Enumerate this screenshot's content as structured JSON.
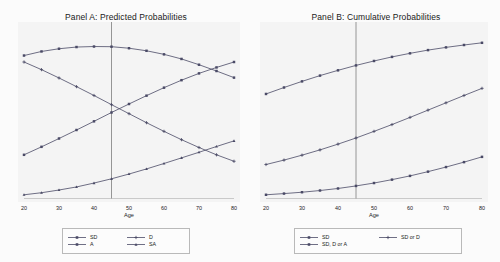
{
  "figure": {
    "background_color": "#fbfbfb",
    "panel_background_color": "#f4f4f4",
    "series_color": "#4a4a66",
    "reference_line_color": "#8a8a8a",
    "axis_color": "#c9c9c9"
  },
  "panels": {
    "a": {
      "title": "Panel A: Predicted Probabilities",
      "xlabel": "Age",
      "legend": [
        {
          "label": "SD",
          "marker": "square"
        },
        {
          "label": "D",
          "marker": "plus"
        },
        {
          "label": "A",
          "marker": "square"
        },
        {
          "label": "SA",
          "marker": "triangle"
        }
      ]
    },
    "b": {
      "title": "Panel B: Cumulative Probabilities",
      "xlabel": "Age",
      "legend": [
        {
          "label": "SD",
          "marker": "square"
        },
        {
          "label": "SD or D",
          "marker": "plus"
        },
        {
          "label": "SD, D or A",
          "marker": "square"
        }
      ]
    }
  },
  "chart_data": [
    {
      "type": "line",
      "panel": "A",
      "title": "Panel A: Predicted Probabilities",
      "xlabel": "Age",
      "ylabel": "",
      "xlim": [
        20,
        80
      ],
      "ylim": [
        0,
        1
      ],
      "xticks": [
        20,
        30,
        40,
        50,
        60,
        70,
        80
      ],
      "xtick_labels": [
        "20",
        "30",
        "40",
        "50",
        "60",
        "70",
        "80"
      ],
      "grid": false,
      "legend_position": "below",
      "annotations": [
        {
          "type": "vertical-reference-line",
          "x": 45
        }
      ],
      "x": [
        20,
        25,
        30,
        35,
        40,
        45,
        50,
        55,
        60,
        65,
        70,
        75,
        80
      ],
      "series": [
        {
          "name": "SD",
          "marker": "square",
          "values": [
            0.838,
            0.862,
            0.878,
            0.888,
            0.891,
            0.89,
            0.881,
            0.866,
            0.845,
            0.818,
            0.784,
            0.747,
            0.708
          ]
        },
        {
          "name": "D",
          "marker": "plus",
          "values": [
            0.8,
            0.755,
            0.706,
            0.655,
            0.603,
            0.549,
            0.496,
            0.443,
            0.392,
            0.343,
            0.297,
            0.254,
            0.216
          ]
        },
        {
          "name": "A",
          "marker": "square",
          "values": [
            0.254,
            0.301,
            0.35,
            0.4,
            0.451,
            0.503,
            0.553,
            0.602,
            0.649,
            0.693,
            0.733,
            0.768,
            0.8
          ]
        },
        {
          "name": "SA",
          "marker": "triangle",
          "values": [
            0.019,
            0.031,
            0.047,
            0.065,
            0.088,
            0.113,
            0.141,
            0.171,
            0.203,
            0.236,
            0.269,
            0.303,
            0.336
          ]
        }
      ]
    },
    {
      "type": "line",
      "panel": "B",
      "title": "Panel B: Cumulative Probabilities",
      "xlabel": "Age",
      "ylabel": "",
      "xlim": [
        20,
        80
      ],
      "ylim": [
        0,
        1
      ],
      "xticks": [
        20,
        30,
        40,
        50,
        60,
        70,
        80
      ],
      "xtick_labels": [
        "20",
        "30",
        "40",
        "50",
        "60",
        "70",
        "80"
      ],
      "grid": false,
      "legend_position": "below",
      "annotations": [
        {
          "type": "vertical-reference-line",
          "x": 45
        }
      ],
      "x": [
        20,
        25,
        30,
        35,
        40,
        45,
        50,
        55,
        60,
        65,
        70,
        75,
        80
      ],
      "series": [
        {
          "name": "SD",
          "marker": "square",
          "values": [
            0.612,
            0.65,
            0.686,
            0.72,
            0.751,
            0.78,
            0.806,
            0.83,
            0.851,
            0.87,
            0.886,
            0.9,
            0.913
          ]
        },
        {
          "name": "SD or D",
          "marker": "plus",
          "values": [
            0.197,
            0.223,
            0.252,
            0.283,
            0.317,
            0.353,
            0.392,
            0.432,
            0.474,
            0.517,
            0.56,
            0.603,
            0.645
          ]
        },
        {
          "name": "SD, D or A",
          "marker": "square",
          "values": [
            0.019,
            0.026,
            0.034,
            0.044,
            0.056,
            0.071,
            0.088,
            0.108,
            0.13,
            0.155,
            0.182,
            0.211,
            0.242
          ]
        }
      ]
    }
  ]
}
